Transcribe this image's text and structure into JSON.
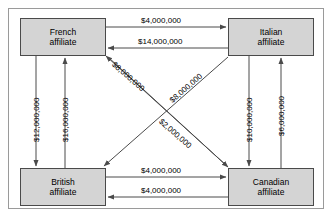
{
  "diagram": {
    "type": "directed-graph",
    "title": "",
    "currency_symbol": "$",
    "nodes": [
      {
        "id": "french",
        "line1": "French",
        "line2": "affiliate"
      },
      {
        "id": "italian",
        "line1": "Italian",
        "line2": "affiliate"
      },
      {
        "id": "british",
        "line1": "British",
        "line2": "affiliate"
      },
      {
        "id": "canadian",
        "line1": "Canadian",
        "line2": "affiliate"
      }
    ],
    "edges": [
      {
        "id": "french-to-italian",
        "from": "french",
        "to": "italian",
        "label": "$4,000,000",
        "orientation": "horizontal-top-upper"
      },
      {
        "id": "italian-to-french",
        "from": "italian",
        "to": "french",
        "label": "$14,000,000",
        "orientation": "horizontal-top-lower"
      },
      {
        "id": "british-to-canadian",
        "from": "british",
        "to": "canadian",
        "label": "$4,000,000",
        "orientation": "horizontal-bottom-upper"
      },
      {
        "id": "canadian-to-british",
        "from": "canadian",
        "to": "british",
        "label": "$4,000,000",
        "orientation": "horizontal-bottom-lower"
      },
      {
        "id": "french-to-british",
        "from": "french",
        "to": "british",
        "label": "$12,000,000",
        "orientation": "vertical-left-outer"
      },
      {
        "id": "british-to-french",
        "from": "british",
        "to": "french",
        "label": "$16,000,000",
        "orientation": "vertical-left-inner"
      },
      {
        "id": "italian-to-canadian",
        "from": "italian",
        "to": "canadian",
        "label": "$10,000,000",
        "orientation": "vertical-right-inner"
      },
      {
        "id": "canadian-to-italian",
        "from": "canadian",
        "to": "italian",
        "label": "$6,000,000",
        "orientation": "vertical-right-outer"
      },
      {
        "id": "italian-to-british",
        "from": "italian",
        "to": "british",
        "label": "$8,000,000",
        "orientation": "diagonal-down-left"
      },
      {
        "id": "canadian-to-french",
        "from": "canadian",
        "to": "french",
        "label": "$8,000,000",
        "orientation": "diagonal-up-left"
      },
      {
        "id": "french-to-canadian",
        "from": "french",
        "to": "canadian",
        "label": "$2,000,000",
        "orientation": "diagonal-down-right"
      }
    ],
    "colors": {
      "node_fill": "#d4d4d4",
      "node_border": "#4a4a4a",
      "line": "#4a4a4a",
      "frame_border": "#9a9a9a",
      "background": "#ffffff",
      "text": "#000000"
    }
  }
}
